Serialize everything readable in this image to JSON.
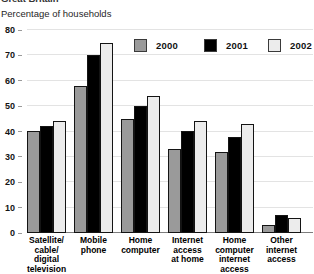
{
  "header": {
    "clipped_top_line": "Great Britain",
    "subtitle": "Percentage of households"
  },
  "legend": [
    {
      "label": "2000",
      "color": "#9a9a9a"
    },
    {
      "label": "2001",
      "color": "#000000"
    },
    {
      "label": "2002",
      "color": "#ececec"
    }
  ],
  "chart_data": {
    "type": "bar",
    "title": "",
    "ylabel": "Percentage of households",
    "xlabel": "",
    "ylim": [
      0,
      80
    ],
    "yticks": [
      0,
      10,
      20,
      30,
      40,
      50,
      60,
      70,
      80
    ],
    "grid": true,
    "legend_position": "top",
    "categories": [
      "Satellite/\ncable/\ndigital\ntelevision",
      "Mobile\nphone",
      "Home\ncomputer",
      "Internet\naccess\nat home",
      "Home\ncomputer\ninternet\naccess",
      "Other\ninternet\naccess"
    ],
    "series": [
      {
        "name": "2000",
        "color": "#9a9a9a",
        "values": [
          40,
          58,
          45,
          33,
          32,
          3
        ]
      },
      {
        "name": "2001",
        "color": "#000000",
        "values": [
          42,
          70,
          50,
          40,
          38,
          7
        ]
      },
      {
        "name": "2002",
        "color": "#ececec",
        "values": [
          44,
          75,
          54,
          44,
          43,
          6
        ]
      }
    ]
  }
}
